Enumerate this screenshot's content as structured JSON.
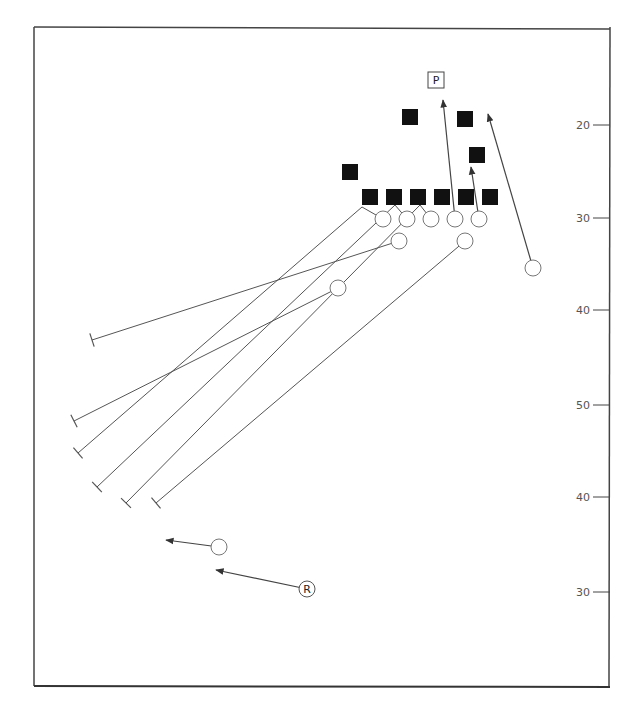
{
  "diagram": {
    "type": "football-play-diagram",
    "frame": {
      "x1": 34,
      "y1": 27,
      "x2": 610,
      "y2": 686
    },
    "sideline": {
      "x": 610,
      "y1": 27,
      "y2": 686
    },
    "yard_markers": [
      {
        "label": "20",
        "y": 125
      },
      {
        "label": "30",
        "y": 218
      },
      {
        "label": "40",
        "y": 310
      },
      {
        "label": "50",
        "y": 405
      },
      {
        "label": "40",
        "y": 497
      },
      {
        "label": "30",
        "y": 592
      }
    ],
    "labels": {
      "punter": "P",
      "returner": "R"
    },
    "defense_squares": [
      {
        "x": 350,
        "y": 172
      },
      {
        "x": 410,
        "y": 117
      },
      {
        "x": 465,
        "y": 119
      },
      {
        "x": 477,
        "y": 155
      },
      {
        "x": 370,
        "y": 197
      },
      {
        "x": 394,
        "y": 197
      },
      {
        "x": 418,
        "y": 197
      },
      {
        "x": 442,
        "y": 197
      },
      {
        "x": 466,
        "y": 197
      },
      {
        "x": 490,
        "y": 197
      }
    ],
    "offense_circles": [
      {
        "x": 383,
        "y": 219
      },
      {
        "x": 407,
        "y": 219
      },
      {
        "x": 431,
        "y": 219
      },
      {
        "x": 455,
        "y": 219
      },
      {
        "x": 479,
        "y": 219
      },
      {
        "x": 399,
        "y": 241
      },
      {
        "x": 465,
        "y": 241
      },
      {
        "x": 338,
        "y": 288
      },
      {
        "x": 533,
        "y": 268
      },
      {
        "x": 219,
        "y": 547
      }
    ],
    "punter": {
      "x": 436,
      "y": 80
    },
    "returner": {
      "x": 307,
      "y": 589
    },
    "block_routes": [
      {
        "points": [
          [
            383,
            219
          ],
          [
            362,
            207
          ],
          [
            78,
            453
          ]
        ],
        "end": [
          78,
          453
        ]
      },
      {
        "points": [
          [
            338,
            288
          ],
          [
            74,
            421
          ]
        ],
        "end": [
          74,
          421
        ]
      },
      {
        "points": [
          [
            399,
            241
          ],
          [
            92,
            340
          ]
        ],
        "end": [
          92,
          340
        ]
      },
      {
        "points": [
          [
            407,
            219
          ],
          [
            395,
            205
          ],
          [
            97,
            487
          ]
        ],
        "end": [
          97,
          487
        ]
      },
      {
        "points": [
          [
            431,
            219
          ],
          [
            420,
            205
          ],
          [
            126,
            503
          ]
        ],
        "end": [
          126,
          503
        ]
      },
      {
        "points": [
          [
            465,
            241
          ],
          [
            156,
            503
          ]
        ],
        "end": [
          156,
          503
        ]
      }
    ],
    "arrow_routes": [
      {
        "from": [
          455,
          219
        ],
        "to": [
          443,
          100
        ]
      },
      {
        "from": [
          479,
          219
        ],
        "to": [
          471,
          167
        ]
      },
      {
        "from": [
          533,
          268
        ],
        "to": [
          488,
          114
        ]
      },
      {
        "from": [
          219,
          547
        ],
        "to": [
          166,
          540
        ]
      },
      {
        "from": [
          307,
          589
        ],
        "to": [
          216,
          570
        ]
      }
    ],
    "colors": {
      "ink": "#222222",
      "line": "#555555",
      "square_fill": "#111111",
      "circle_stroke": "#777777"
    }
  }
}
